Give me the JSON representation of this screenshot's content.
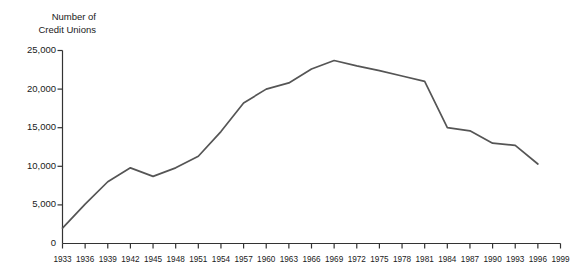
{
  "chart_data": {
    "type": "line",
    "title_line1": "Number of",
    "title_line2": "Credit Unions",
    "xlabel": "",
    "ylabel": "Number of Credit Unions",
    "ylim": [
      0,
      25000
    ],
    "xlim": [
      1933,
      1999
    ],
    "grid": false,
    "legend": null,
    "line_color": "#555555",
    "axis_color": "#333333",
    "ytick_labels": [
      "0",
      "5,000",
      "10,000",
      "15,000",
      "20,000",
      "25,000"
    ],
    "ytick_values": [
      0,
      5000,
      10000,
      15000,
      20000,
      25000
    ],
    "xtick_labels": [
      "1933",
      "1936",
      "1939",
      "1942",
      "1945",
      "1948",
      "1951",
      "1954",
      "1957",
      "1960",
      "1963",
      "1966",
      "1969",
      "1972",
      "1975",
      "1978",
      "1981",
      "1984",
      "1987",
      "1990",
      "1993",
      "1996",
      "1999"
    ],
    "x": [
      1933,
      1936,
      1939,
      1942,
      1945,
      1948,
      1951,
      1954,
      1957,
      1960,
      1963,
      1966,
      1969,
      1972,
      1975,
      1978,
      1981,
      1984,
      1987,
      1990,
      1993,
      1996
    ],
    "values": [
      2000,
      5100,
      8000,
      9800,
      8700,
      9800,
      11300,
      14500,
      18200,
      20000,
      20800,
      22600,
      23700,
      23000,
      22400,
      21700,
      21000,
      15000,
      14600,
      13000,
      12700,
      10300
    ],
    "series": [
      {
        "name": "Number of Credit Unions",
        "values": [
          2000,
          5100,
          8000,
          9800,
          8700,
          9800,
          11300,
          14500,
          18200,
          20000,
          20800,
          22600,
          23700,
          23000,
          22400,
          21700,
          21000,
          15000,
          14600,
          13000,
          12700,
          10300
        ]
      }
    ]
  }
}
